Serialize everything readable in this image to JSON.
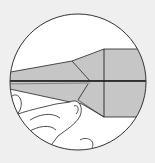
{
  "diagram": {
    "type": "origami-instruction-step",
    "colors": {
      "background": "#efefef",
      "circle": "#ffffff",
      "paper": "#c6c6c6",
      "line": "#222222"
    }
  }
}
